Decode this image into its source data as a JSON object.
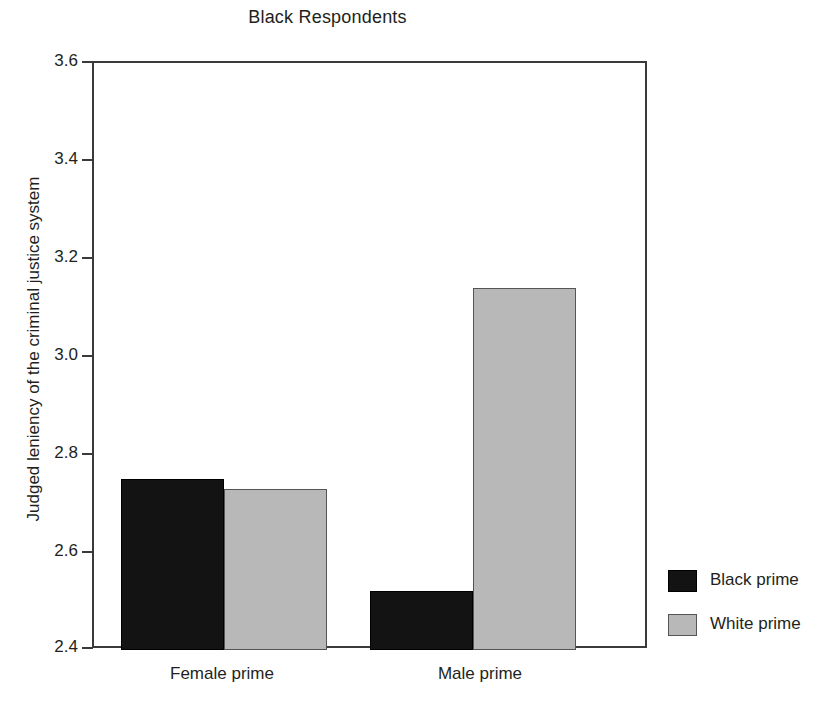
{
  "chart_data": {
    "type": "bar",
    "title": "Black Respondents",
    "xlabel": "",
    "ylabel": "Judged leniency of the criminal justice system",
    "categories": [
      "Female prime",
      "Male prime"
    ],
    "series": [
      {
        "name": "Black prime",
        "values": [
          2.75,
          2.52
        ],
        "color": "#131313"
      },
      {
        "name": "White prime",
        "values": [
          2.73,
          3.14
        ],
        "color": "#b8b8b8"
      }
    ],
    "ylim": [
      2.4,
      3.6
    ],
    "ytick_step": 0.2,
    "yticks": [
      "3.6",
      "3.4",
      "3.2",
      "3.0",
      "2.8",
      "2.6",
      "2.4"
    ],
    "grid": false,
    "legend_position": "right"
  },
  "legend": {
    "items": [
      {
        "label": "Black prime",
        "swatch": "dark"
      },
      {
        "label": "White prime",
        "swatch": "light"
      }
    ]
  }
}
